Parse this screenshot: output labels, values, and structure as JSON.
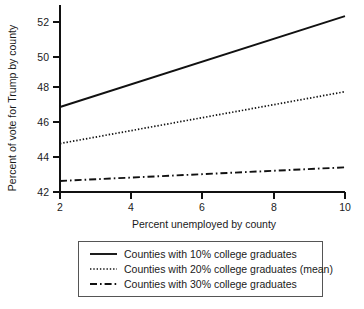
{
  "chart_data": {
    "type": "line",
    "title": "",
    "xlabel": "Percent unemployed by county",
    "ylabel": "Percent of vote for Trump by county",
    "xlim": [
      2,
      10
    ],
    "ylim": [
      42,
      52.8
    ],
    "xticks": [
      2,
      4,
      6,
      8,
      10
    ],
    "yticks": [
      42,
      44,
      46,
      48,
      50,
      52
    ],
    "xticklabels": [
      "2",
      "4",
      "6",
      "8",
      "10"
    ],
    "yticklabels": [
      "42",
      "44",
      "46",
      "48",
      "50",
      "52"
    ],
    "grid": false,
    "legend_position": "below-axes",
    "x": [
      2,
      10
    ],
    "series": [
      {
        "name": "Counties with 10% college graduates",
        "style": "solid",
        "values": [
          47.0,
          52.35
        ]
      },
      {
        "name": "Counties with 20% college graduates (mean)",
        "style": "dotted",
        "values": [
          44.85,
          47.9
        ]
      },
      {
        "name": "Counties with 30% college graduates",
        "style": "dashdot",
        "values": [
          42.65,
          43.45
        ]
      }
    ]
  },
  "axes": {
    "x_title": "Percent unemployed by county",
    "y_title": "Percent of vote for Trump by county",
    "x_tick_labels": [
      "2",
      "4",
      "6",
      "8",
      "10"
    ],
    "y_tick_labels": [
      "42",
      "44",
      "46",
      "48",
      "50",
      "52"
    ]
  },
  "legend": {
    "entries": [
      {
        "label": "Counties with 10% college graduates",
        "style": "solid"
      },
      {
        "label": "Counties with 20% college graduates (mean)",
        "style": "dotted"
      },
      {
        "label": "Counties with 30% college graduates",
        "style": "dashdot"
      }
    ]
  },
  "colors": {
    "line": "#111111",
    "text": "#1a1a1a",
    "background": "#ffffff",
    "legend_border": "#555555"
  }
}
